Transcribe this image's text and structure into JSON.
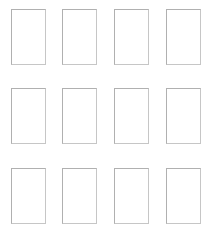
{
  "page": {
    "background_color": "#ffffff",
    "width": 214,
    "height": 233
  },
  "grid": {
    "columns": 4,
    "rows": 3,
    "total_cards": 12,
    "card_width": 35,
    "card_height": 56,
    "column_gap": 17,
    "row_gap": 23,
    "border_color": "#bdbdbd",
    "card_fill_color": "#ffffff",
    "cards": [
      {
        "id": "card-r1c1",
        "row": 1,
        "col": 1,
        "label": ""
      },
      {
        "id": "card-r1c2",
        "row": 1,
        "col": 2,
        "label": ""
      },
      {
        "id": "card-r1c3",
        "row": 1,
        "col": 3,
        "label": ""
      },
      {
        "id": "card-r1c4",
        "row": 1,
        "col": 4,
        "label": ""
      },
      {
        "id": "card-r2c1",
        "row": 2,
        "col": 1,
        "label": ""
      },
      {
        "id": "card-r2c2",
        "row": 2,
        "col": 2,
        "label": ""
      },
      {
        "id": "card-r2c3",
        "row": 2,
        "col": 3,
        "label": ""
      },
      {
        "id": "card-r2c4",
        "row": 2,
        "col": 4,
        "label": ""
      },
      {
        "id": "card-r3c1",
        "row": 3,
        "col": 1,
        "label": ""
      },
      {
        "id": "card-r3c2",
        "row": 3,
        "col": 2,
        "label": ""
      },
      {
        "id": "card-r3c3",
        "row": 3,
        "col": 3,
        "label": ""
      },
      {
        "id": "card-r3c4",
        "row": 3,
        "col": 4,
        "label": ""
      }
    ]
  }
}
